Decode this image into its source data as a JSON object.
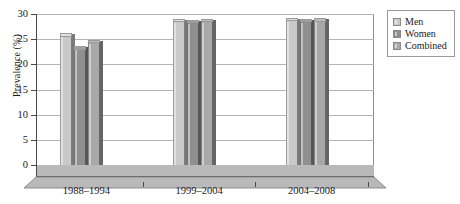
{
  "chart_data": {
    "type": "bar",
    "title": "",
    "xlabel": "",
    "ylabel": "Prevalence (%)",
    "categories": [
      "1988–1994",
      "1999–2004",
      "2004–2008"
    ],
    "series": [
      {
        "name": "Men",
        "values": [
          25.6,
          28.5,
          28.7
        ],
        "color": "#c9c9c9"
      },
      {
        "name": "Women",
        "values": [
          23.0,
          28.3,
          28.5
        ],
        "color": "#8f8f8f"
      },
      {
        "name": "Combined",
        "values": [
          24.3,
          28.5,
          28.6
        ],
        "color": "#a8a8a8"
      }
    ],
    "ylim": [
      0,
      30
    ],
    "yticks": [
      0,
      5,
      10,
      15,
      20,
      25,
      30
    ],
    "ytick_labels": [
      "0",
      "5",
      "10",
      "15",
      "20",
      "25",
      "30"
    ],
    "grid": true,
    "legend_position": "right",
    "style": "3d-column"
  },
  "legend": {
    "items": [
      {
        "label": "Men"
      },
      {
        "label": "Women"
      },
      {
        "label": "Combined"
      }
    ]
  },
  "axis": {
    "y_title": "Prevalence (%)"
  }
}
